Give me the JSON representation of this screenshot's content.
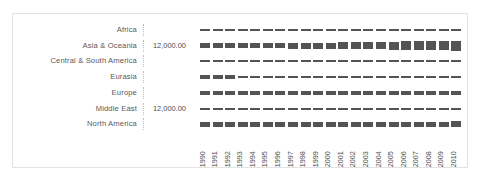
{
  "chart_data": {
    "type": "heatmap",
    "title": "",
    "xlabel": "",
    "ylabel": "",
    "grid": false,
    "legend": "none",
    "encoding": "bar-thickness",
    "categories": [
      "1990",
      "1991",
      "1992",
      "1993",
      "1994",
      "1995",
      "1996",
      "1997",
      "1998",
      "1999",
      "2000",
      "2001",
      "2002",
      "2003",
      "2004",
      "2005",
      "2006",
      "2007",
      "2008",
      "2009",
      "2010"
    ],
    "row_names": [
      "Africa",
      "Asia & Oceania",
      "Central & South America",
      "Eurasia",
      "Europe",
      "Middle East",
      "North America"
    ],
    "row_value_labels": [
      "",
      "12,000.00",
      "",
      "",
      "",
      "12,000.00",
      ""
    ],
    "series": [
      {
        "name": "Africa",
        "values": [
          2.0,
          2.0,
          2.0,
          2.0,
          2.0,
          2.0,
          2.0,
          2.0,
          2.0,
          2.0,
          2.0,
          2.0,
          2.0,
          2.0,
          2.0,
          2.0,
          2.0,
          2.0,
          2.0,
          2.0,
          2.0
        ]
      },
      {
        "name": "Asia & Oceania",
        "values": [
          4.5,
          4.5,
          4.6,
          5.0,
          5.2,
          5.4,
          5.6,
          5.8,
          5.8,
          6.0,
          6.2,
          6.4,
          6.6,
          6.9,
          7.4,
          8.0,
          8.4,
          8.8,
          9.0,
          9.3,
          9.8
        ]
      },
      {
        "name": "Central & South America",
        "values": [
          2.0,
          2.0,
          2.0,
          2.0,
          2.0,
          2.0,
          2.0,
          2.0,
          2.0,
          2.0,
          2.0,
          2.0,
          2.0,
          2.0,
          2.0,
          2.0,
          2.0,
          2.0,
          2.0,
          2.0,
          2.0
        ]
      },
      {
        "name": "Eurasia",
        "values": [
          3.4,
          3.3,
          3.2,
          2.6,
          2.3,
          2.2,
          2.2,
          2.1,
          2.1,
          2.1,
          2.1,
          2.1,
          2.1,
          2.1,
          2.1,
          2.1,
          2.1,
          2.1,
          2.1,
          2.1,
          2.1
        ]
      },
      {
        "name": "Europe",
        "values": [
          4.0,
          4.0,
          4.0,
          4.0,
          4.0,
          4.0,
          4.0,
          4.0,
          4.0,
          4.0,
          4.0,
          4.0,
          4.0,
          4.0,
          4.0,
          4.0,
          4.0,
          4.0,
          4.0,
          4.0,
          4.0
        ]
      },
      {
        "name": "Middle East",
        "values": [
          2.0,
          2.0,
          2.0,
          2.0,
          2.0,
          2.0,
          2.0,
          2.0,
          2.0,
          2.0,
          2.0,
          2.0,
          2.0,
          2.0,
          2.0,
          2.0,
          2.0,
          2.0,
          2.0,
          2.0,
          2.0
        ]
      },
      {
        "name": "North America",
        "values": [
          5.0,
          5.0,
          5.0,
          5.0,
          5.0,
          5.0,
          5.0,
          5.0,
          5.2,
          5.2,
          5.2,
          5.2,
          5.2,
          5.2,
          5.2,
          5.2,
          5.2,
          5.2,
          5.2,
          5.2,
          5.4
        ]
      }
    ],
    "mark_color": "#545456",
    "frame_color": "#e2e2e2"
  }
}
